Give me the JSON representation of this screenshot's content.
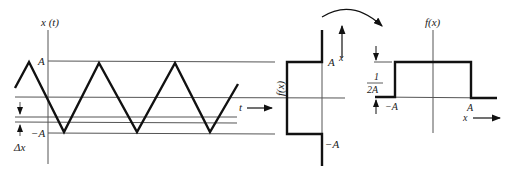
{
  "panel_left": {
    "y_axis_label": "x (t)",
    "label_A": "A",
    "label_negA": "−A",
    "label_dx": "Δx",
    "label_t": "t",
    "waveform": "triangle wave between A and −A"
  },
  "panel_middle": {
    "axis_label": "f(x)",
    "label_A": "A",
    "label_negA": "−A",
    "label_x": "x"
  },
  "panel_right": {
    "axis_label": "f(x)",
    "label_height_num": "1",
    "label_height_den": "2A",
    "label_negA": "−A",
    "label_A": "A",
    "label_x": "x"
  },
  "colors": {
    "line": "#111111",
    "thin_line": "#555555",
    "background": "#ffffff"
  }
}
